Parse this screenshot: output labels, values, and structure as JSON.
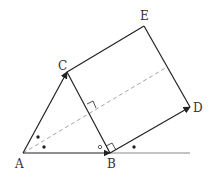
{
  "diagram": {
    "points": {
      "A": {
        "label": "A",
        "x": 23,
        "y": 153
      },
      "B": {
        "label": "B",
        "x": 110,
        "y": 153
      },
      "C": {
        "label": "C",
        "x": 67,
        "y": 72
      },
      "D": {
        "label": "D",
        "x": 190,
        "y": 107
      },
      "E": {
        "label": "E",
        "x": 144,
        "y": 26
      }
    },
    "labels": {
      "A": "A",
      "B": "B",
      "C": "C",
      "D": "D",
      "E": "E"
    },
    "colors": {
      "stroke": "#222222",
      "baseline": "#888888",
      "dashed": "#999999"
    }
  }
}
